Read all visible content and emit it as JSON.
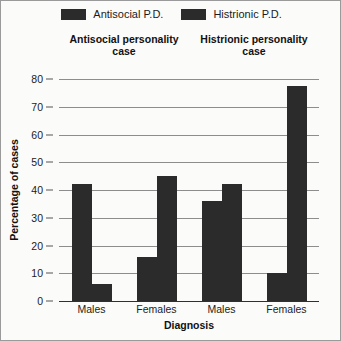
{
  "chart_data": {
    "type": "bar",
    "title": "",
    "xlabel": "Diagnosis",
    "ylabel": "Percentage of cases",
    "ylim": [
      0,
      80
    ],
    "ytick_step": 10,
    "yticks": [
      80,
      70,
      60,
      50,
      40,
      30,
      20,
      10,
      0
    ],
    "grid": true,
    "legend_position": "top-center",
    "categories": [
      "Males",
      "Females",
      "Males",
      "Females"
    ],
    "group_headers": [
      {
        "line1": "Antisocial personality",
        "line2": "case"
      },
      {
        "line1": "Histrionic personality",
        "line2": "case"
      }
    ],
    "series": [
      {
        "name": "Antisocial P.D.",
        "color": "#2b2b2b",
        "values": [
          42,
          16,
          36,
          10
        ]
      },
      {
        "name": "Histrionic P.D.",
        "color": "#2b2b2b",
        "values": [
          6,
          45,
          42,
          77.5
        ]
      }
    ],
    "bars": [
      {
        "group": 0,
        "group_label": "Males",
        "series": "Antisocial P.D.",
        "value": 42
      },
      {
        "group": 0,
        "group_label": "Males",
        "series": "Histrionic P.D.",
        "value": 6
      },
      {
        "group": 1,
        "group_label": "Females",
        "series": "Antisocial P.D.",
        "value": 16
      },
      {
        "group": 1,
        "group_label": "Females",
        "series": "Histrionic P.D.",
        "value": 45
      },
      {
        "group": 2,
        "group_label": "Males",
        "series": "Antisocial P.D.",
        "value": 36
      },
      {
        "group": 2,
        "group_label": "Males",
        "series": "Histrionic P.D.",
        "value": 42
      },
      {
        "group": 3,
        "group_label": "Females",
        "series": "Antisocial P.D.",
        "value": 10
      },
      {
        "group": 3,
        "group_label": "Females",
        "series": "Histrionic P.D.",
        "value": 77.5
      }
    ]
  },
  "legend": {
    "items": [
      {
        "label": "Antisocial P.D.",
        "color": "#2b2b2b"
      },
      {
        "label": "Histrionic P.D.",
        "color": "#2b2b2b"
      }
    ]
  },
  "headers": {
    "left_line1": "Antisocial personality",
    "left_line2": "case",
    "right_line1": "Histrionic personality",
    "right_line2": "case"
  },
  "axes": {
    "y_title": "Percentage of cases",
    "x_title": "Diagnosis",
    "y_tick_labels": [
      "80",
      "70",
      "60",
      "50",
      "40",
      "30",
      "20",
      "10",
      "0"
    ],
    "x_tick_labels": [
      "Males",
      "Females",
      "Males",
      "Females"
    ]
  }
}
